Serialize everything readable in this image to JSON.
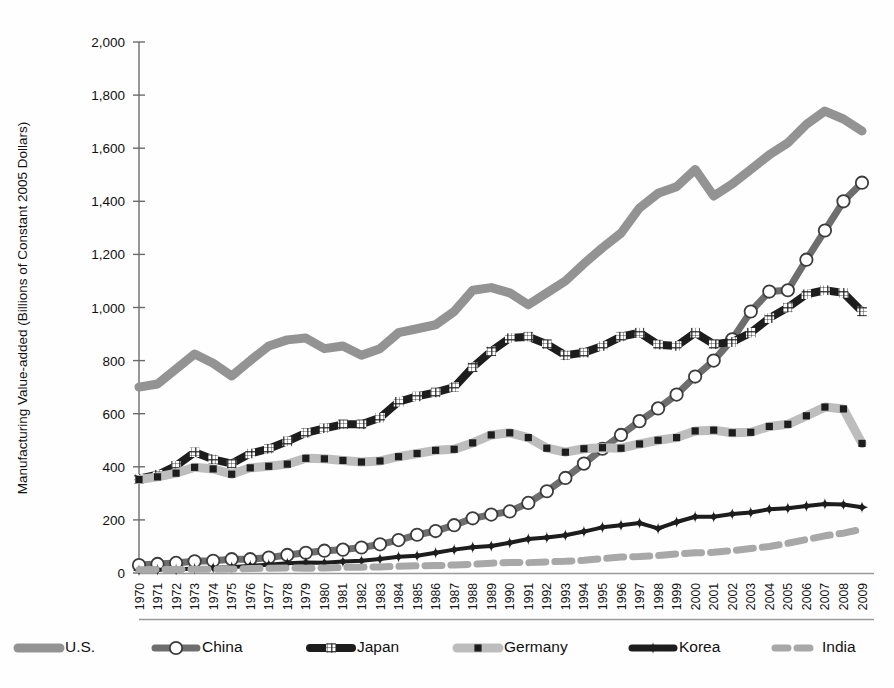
{
  "figure": {
    "background_color": "#fefefe",
    "width": 894,
    "height": 688
  },
  "chart_data": {
    "type": "line",
    "title": "",
    "subtitle": "",
    "xlabel": "",
    "ylabel": "Manufacturing Value-added (Billions of Constant 2005 Dollars)",
    "ylim": [
      0,
      2000
    ],
    "ytick_labels": [
      "0",
      "200",
      "400",
      "600",
      "800",
      "1,000",
      "1,200",
      "1,400",
      "1,600",
      "1,800",
      "2,000"
    ],
    "ytick_values": [
      0,
      200,
      400,
      600,
      800,
      1000,
      1200,
      1400,
      1600,
      1800,
      2000
    ],
    "grid": false,
    "legend_position": "bottom",
    "x": [
      1970,
      1971,
      1972,
      1973,
      1974,
      1975,
      1976,
      1977,
      1978,
      1979,
      1980,
      1981,
      1982,
      1983,
      1984,
      1985,
      1986,
      1987,
      1988,
      1989,
      1990,
      1991,
      1992,
      1993,
      1994,
      1995,
      1996,
      1997,
      1998,
      1999,
      2000,
      2001,
      2002,
      2003,
      2004,
      2005,
      2006,
      2007,
      2008,
      2009
    ],
    "categories": [
      "1970",
      "1971",
      "1972",
      "1973",
      "1974",
      "1975",
      "1976",
      "1977",
      "1978",
      "1979",
      "1980",
      "1981",
      "1982",
      "1983",
      "1984",
      "1985",
      "1986",
      "1987",
      "1988",
      "1989",
      "1990",
      "1991",
      "1992",
      "1993",
      "1994",
      "1995",
      "1996",
      "1997",
      "1998",
      "1999",
      "2000",
      "2001",
      "2002",
      "2003",
      "2004",
      "2005",
      "2006",
      "2007",
      "2008",
      "2009"
    ],
    "series": [
      {
        "name": "U.S.",
        "color": "#939393",
        "marker": "none",
        "line_style": "solid",
        "line_width": 9,
        "values": [
          700,
          712,
          768,
          825,
          790,
          742,
          800,
          855,
          878,
          885,
          845,
          855,
          820,
          845,
          905,
          920,
          935,
          985,
          1065,
          1075,
          1055,
          1010,
          1055,
          1100,
          1165,
          1225,
          1280,
          1375,
          1430,
          1455,
          1520,
          1420,
          1465,
          1520,
          1575,
          1620,
          1690,
          1740,
          1710,
          1665
        ]
      },
      {
        "name": "China",
        "color": "#6e6e6e",
        "marker": "circle-open",
        "line_style": "solid",
        "line_width": 7,
        "values": [
          30,
          34,
          38,
          44,
          46,
          52,
          52,
          58,
          68,
          76,
          84,
          88,
          96,
          108,
          124,
          144,
          158,
          180,
          206,
          220,
          232,
          264,
          308,
          358,
          412,
          468,
          520,
          572,
          620,
          672,
          740,
          800,
          880,
          985,
          1060,
          1065,
          1180,
          1290,
          1400,
          1470
        ]
      },
      {
        "name": "Japan",
        "color": "#1d1d1d",
        "marker": "square-grid",
        "line_style": "solid",
        "line_width": 8,
        "values": [
          355,
          370,
          404,
          455,
          428,
          412,
          450,
          468,
          496,
          528,
          545,
          560,
          560,
          585,
          645,
          665,
          680,
          700,
          775,
          835,
          885,
          890,
          862,
          820,
          830,
          855,
          890,
          905,
          860,
          855,
          905,
          862,
          870,
          905,
          960,
          1000,
          1050,
          1065,
          1055,
          985
        ]
      },
      {
        "name": "Germany",
        "color": "#bdbdbd",
        "marker": "square-small",
        "line_style": "solid",
        "line_width": 9,
        "values": [
          352,
          362,
          376,
          398,
          392,
          372,
          396,
          402,
          410,
          432,
          430,
          424,
          418,
          422,
          438,
          450,
          462,
          466,
          490,
          520,
          528,
          510,
          470,
          455,
          468,
          472,
          470,
          486,
          500,
          510,
          535,
          538,
          528,
          530,
          552,
          560,
          592,
          625,
          618,
          488
        ]
      },
      {
        "name": "Korea",
        "color": "#1d1d1d",
        "marker": "diamond",
        "line_style": "solid",
        "line_width": 4,
        "values": [
          10,
          12,
          13,
          17,
          20,
          22,
          27,
          31,
          37,
          40,
          39,
          43,
          46,
          53,
          61,
          65,
          76,
          88,
          97,
          102,
          114,
          128,
          134,
          142,
          156,
          172,
          180,
          188,
          168,
          192,
          212,
          212,
          222,
          228,
          240,
          244,
          252,
          260,
          258,
          248
        ]
      },
      {
        "name": "India",
        "color": "#a8a8a8",
        "marker": "none",
        "line_style": "dashed",
        "line_width": 7,
        "values": [
          12,
          13,
          13,
          14,
          14,
          15,
          17,
          18,
          19,
          18,
          19,
          21,
          22,
          23,
          25,
          27,
          28,
          30,
          33,
          37,
          40,
          39,
          42,
          44,
          48,
          54,
          60,
          62,
          66,
          72,
          76,
          78,
          84,
          92,
          100,
          112,
          126,
          140,
          150,
          165
        ]
      }
    ]
  },
  "legend": {
    "items": [
      {
        "label": "U.S."
      },
      {
        "label": "China"
      },
      {
        "label": "Japan"
      },
      {
        "label": "Germany"
      },
      {
        "label": "Korea"
      },
      {
        "label": "India"
      }
    ]
  },
  "plot_geometry": {
    "left": 139,
    "right": 862,
    "top": 42,
    "bottom": 573
  }
}
